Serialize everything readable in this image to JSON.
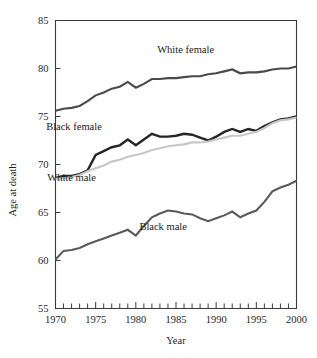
{
  "chart_data": {
    "type": "line",
    "title": "",
    "xlabel": "Year",
    "ylabel": "Age at death",
    "xlim": [
      1970,
      2000
    ],
    "ylim": [
      55,
      85
    ],
    "grid": false,
    "legend_position": "inline-annotations",
    "x_tick_labels": [
      "1970",
      "1975",
      "1980",
      "1985",
      "1990",
      "1995",
      "2000"
    ],
    "x_tick_values": [
      1970,
      1975,
      1980,
      1985,
      1990,
      1995,
      2000
    ],
    "x_minor_ticks_every": 1,
    "y_tick_labels": [
      "55",
      "60",
      "65",
      "70",
      "75",
      "80",
      "85"
    ],
    "y_tick_values": [
      55,
      60,
      65,
      70,
      75,
      80,
      85
    ],
    "x": [
      1970,
      1971,
      1972,
      1973,
      1974,
      1975,
      1976,
      1977,
      1978,
      1979,
      1980,
      1981,
      1982,
      1983,
      1984,
      1985,
      1986,
      1987,
      1988,
      1989,
      1990,
      1991,
      1992,
      1993,
      1994,
      1995,
      1996,
      1997,
      1998,
      1999,
      2000
    ],
    "series": [
      {
        "name": "White female",
        "color": "#4a4a4a",
        "width": 2.1,
        "label_x": 1986.2,
        "label_y": 81.6,
        "values": [
          75.6,
          75.8,
          75.9,
          76.1,
          76.6,
          77.2,
          77.5,
          77.9,
          78.1,
          78.6,
          78.0,
          78.4,
          78.9,
          78.9,
          79.0,
          79.0,
          79.1,
          79.2,
          79.2,
          79.4,
          79.5,
          79.7,
          79.9,
          79.5,
          79.6,
          79.6,
          79.7,
          79.9,
          80.0,
          80.0,
          80.2
        ]
      },
      {
        "name": "Black female",
        "color": "#262626",
        "width": 2.4,
        "label_x": 1972.3,
        "label_y": 73.6,
        "values": [
          68.6,
          68.8,
          68.8,
          69.0,
          69.4,
          71.0,
          71.4,
          71.8,
          72.0,
          72.6,
          72.0,
          72.6,
          73.2,
          72.9,
          72.9,
          73.0,
          73.2,
          73.1,
          72.8,
          72.5,
          72.9,
          73.4,
          73.7,
          73.4,
          73.7,
          73.5,
          74.0,
          74.4,
          74.7,
          74.8,
          75.0
        ]
      },
      {
        "name": "White male",
        "color": "#c7c7c7",
        "width": 2.1,
        "label_x": 1972.0,
        "label_y": 68.3,
        "values": [
          68.5,
          68.6,
          68.7,
          68.9,
          69.3,
          69.6,
          69.9,
          70.3,
          70.5,
          70.8,
          71.0,
          71.2,
          71.5,
          71.7,
          71.9,
          72.0,
          72.1,
          72.3,
          72.3,
          72.4,
          72.6,
          72.8,
          73.0,
          73.0,
          73.2,
          73.4,
          73.8,
          74.3,
          74.6,
          74.7,
          74.9
        ]
      },
      {
        "name": "Black male",
        "color": "#5a5a5a",
        "width": 2.1,
        "label_x": 1983.4,
        "label_y": 63.2,
        "values": [
          60.1,
          61.0,
          61.1,
          61.3,
          61.7,
          62.0,
          62.3,
          62.6,
          62.9,
          63.2,
          62.6,
          63.6,
          64.5,
          64.9,
          65.2,
          65.1,
          64.9,
          64.8,
          64.4,
          64.1,
          64.4,
          64.7,
          65.1,
          64.5,
          64.9,
          65.2,
          66.1,
          67.2,
          67.6,
          67.9,
          68.3
        ]
      }
    ]
  },
  "axis": {
    "y_title": "Age at death",
    "x_title": "Year"
  }
}
